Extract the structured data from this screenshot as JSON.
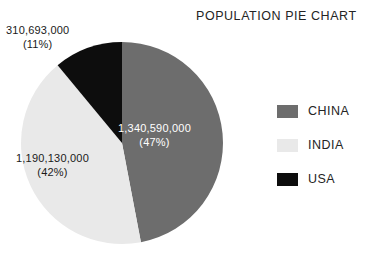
{
  "title": "POPULATION PIE CHART",
  "chart_data": {
    "type": "pie",
    "title": "POPULATION PIE CHART",
    "xlabel": "",
    "ylabel": "",
    "grid": false,
    "legend_position": "right",
    "start_angle_deg": 0,
    "direction": "clockwise",
    "center": {
      "x": 122,
      "y": 143
    },
    "radius": 101,
    "categories": [
      "CHINA",
      "INDIA",
      "USA"
    ],
    "values": [
      1340590000,
      1190130000,
      310693000
    ],
    "percents": [
      47,
      42,
      11
    ],
    "colors": [
      "#6d6d6d",
      "#e9e9e9",
      "#0d0d0d"
    ],
    "slices": [
      {
        "name": "CHINA",
        "value": 1340590000,
        "value_label": "1,340,590,000",
        "percent": 47,
        "percent_label": "(47%)",
        "color": "#6d6d6d",
        "label_color": "#ffffff",
        "start_deg": 0,
        "sweep_deg": 169.2
      },
      {
        "name": "INDIA",
        "value": 1190130000,
        "value_label": "1,190,130,000",
        "percent": 42,
        "percent_label": "(42%)",
        "color": "#e9e9e9",
        "label_color": "#1a1a1a",
        "start_deg": 169.2,
        "sweep_deg": 151.2
      },
      {
        "name": "USA",
        "value": 310693000,
        "value_label": "310,693,000",
        "percent": 11,
        "percent_label": "(11%)",
        "color": "#0d0d0d",
        "label_color": "#1a1a1a",
        "start_deg": 320.4,
        "sweep_deg": 39.6
      }
    ]
  },
  "legend": {
    "items": [
      {
        "label": "CHINA",
        "color": "#6d6d6d"
      },
      {
        "label": "INDIA",
        "color": "#e9e9e9"
      },
      {
        "label": "USA",
        "color": "#0d0d0d"
      }
    ]
  }
}
